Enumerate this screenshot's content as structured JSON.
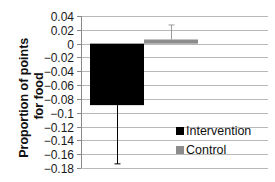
{
  "chart_data": {
    "type": "bar",
    "title": "",
    "xlabel": "",
    "ylabel": "Proportion of points for food",
    "ylabel_lines": [
      "Proportion of points",
      "for food"
    ],
    "ylim": [
      -0.18,
      0.04
    ],
    "yticks": [
      0.04,
      0.02,
      0,
      -0.02,
      -0.04,
      -0.06,
      -0.08,
      -0.1,
      -0.12,
      -0.14,
      -0.16,
      -0.18
    ],
    "ytick_labels": [
      "0.04",
      "0.02",
      "0",
      "−0.02",
      "−0.04",
      "−0.06",
      "−0.08",
      "−0.1",
      "−0.12",
      "−0.14",
      "−0.16",
      "−0.18"
    ],
    "grid": true,
    "legend_position": "bottom-right",
    "series": [
      {
        "name": "Intervention",
        "value": -0.089,
        "error": 0.085,
        "color": "#000000"
      },
      {
        "name": "Control",
        "value": 0.006,
        "error": 0.021,
        "color": "#8c8c8c"
      }
    ]
  }
}
